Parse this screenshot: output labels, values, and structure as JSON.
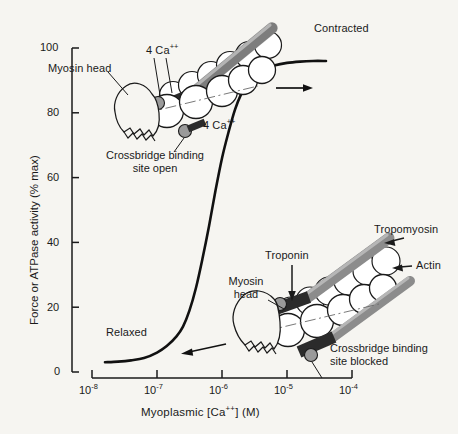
{
  "figure": {
    "background_color": "#f6f5f1",
    "ink_color": "#1a1a1a",
    "tropomyosin_color": "#8c8c8c",
    "troponin_color": "#2b2b2b",
    "actin_color": "#ffffff",
    "binding_site_color": "#9a9a9a"
  },
  "axes": {
    "y": {
      "title": "Force or ATPase activity (% max)",
      "ticks": [
        "100",
        "80",
        "60",
        "40",
        "20",
        "0"
      ],
      "tick_values": [
        100,
        80,
        60,
        40,
        20,
        0
      ],
      "range": [
        0,
        100
      ]
    },
    "x": {
      "title_parts": {
        "pre": "Myoplasmic [Ca",
        "sup": "++",
        "post": "]  (M)"
      },
      "title": "Myoplasmic [Ca++] (M)",
      "ticks": [
        {
          "base": "10",
          "exp": "-8"
        },
        {
          "base": "10",
          "exp": "-7"
        },
        {
          "base": "10",
          "exp": "-6"
        },
        {
          "base": "10",
          "exp": "-5"
        },
        {
          "base": "10",
          "exp": "-4"
        }
      ],
      "range_log10": [
        -8,
        -4
      ]
    }
  },
  "annotations": {
    "contracted": "Contracted",
    "relaxed": "Relaxed",
    "myosin_head_top": "Myosin head",
    "myosin_head_bottom_l1": "Myosin",
    "myosin_head_bottom_l2": "head",
    "ca_top": {
      "pre": "4 Ca",
      "sup": "++"
    },
    "ca_bottom": {
      "pre": "4 Ca",
      "sup": "++"
    },
    "crossbridge_open_l1": "Crossbridge binding",
    "crossbridge_open_l2": "site open",
    "crossbridge_blocked_l1": "Crossbridge binding",
    "crossbridge_blocked_l2": "site blocked",
    "troponin": "Troponin",
    "tropomyosin": "Tropomyosin",
    "actin": "Actin"
  },
  "chart_data": {
    "type": "line",
    "title": "",
    "xlabel": "Myoplasmic [Ca++] (M)",
    "ylabel": "Force or ATPase activity (% max)",
    "xlim_log10": [
      -8,
      -4
    ],
    "ylim": [
      0,
      100
    ],
    "xticks_log10": [
      -8,
      -7,
      -6,
      -5,
      -4
    ],
    "xticklabels": [
      "10-8",
      "10-7",
      "10-6",
      "10-5",
      "10-4"
    ],
    "yticks": [
      0,
      20,
      40,
      60,
      80,
      100
    ],
    "grid": false,
    "legend": null,
    "series": [
      {
        "name": "Force / ATPase activity",
        "x_log10": [
          -7.8,
          -7.6,
          -7.4,
          -7.2,
          -7.0,
          -6.85,
          -6.7,
          -6.6,
          -6.5,
          -6.4,
          -6.3,
          -6.2,
          -6.1,
          -6.0,
          -5.9,
          -5.8,
          -5.7,
          -5.6,
          -5.5,
          -5.35,
          -5.2,
          -5.0,
          -4.8,
          -4.6,
          -4.4
        ],
        "y": [
          3,
          3.2,
          3.6,
          4.3,
          6,
          8,
          11,
          14,
          19,
          26,
          35,
          45,
          56,
          66,
          74,
          81,
          86,
          89.5,
          91.8,
          93.6,
          94.6,
          95.4,
          95.8,
          96,
          96
        ],
        "style": "solid",
        "linewidth": 2.6,
        "color": "#111111"
      }
    ],
    "plateau_low": 3,
    "plateau_high": 96,
    "midpoint_log10": -6.12
  }
}
